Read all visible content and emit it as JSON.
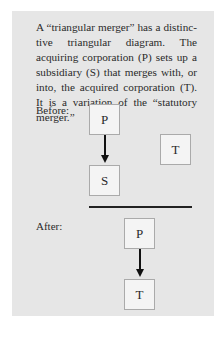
{
  "description": "A “triangular merger” has a distinc­tive triangular diagram. The acquiring corporation (P) sets up a subsidiary (S) that merges with, or into, the ac­quired corporation (T). It is a varia­tion of the “statutory merger.”",
  "before": {
    "label": "Before:",
    "boxes": {
      "parent": "P",
      "subsidiary": "S",
      "target": "T"
    }
  },
  "after": {
    "label": "After:",
    "boxes": {
      "parent": "P",
      "target": "T"
    }
  }
}
